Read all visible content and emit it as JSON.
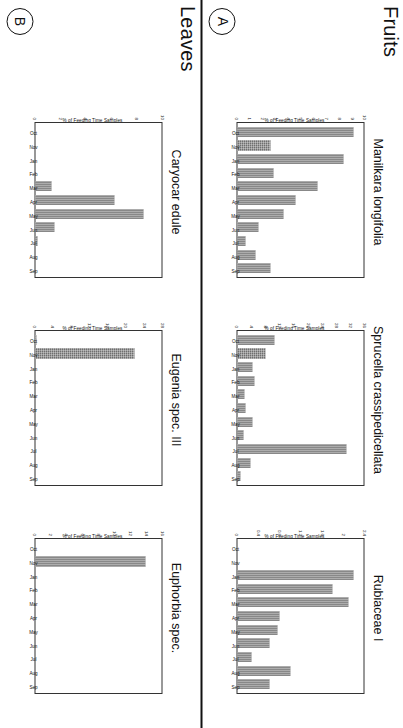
{
  "figure": {
    "sections": [
      {
        "id": "fruits",
        "label": "Fruits",
        "panel_tag": "A"
      },
      {
        "id": "leaves",
        "label": "Leaves",
        "panel_tag": "B"
      }
    ],
    "axis_label": "% of Feeding Time Samples",
    "months": [
      "Oct",
      "Nov",
      "Jan",
      "Feb",
      "Mar",
      "Apr",
      "May",
      "Jun",
      "Jul",
      "Aug",
      "Sep"
    ],
    "bar_color": "#6f6f6f"
  },
  "chart_data": [
    {
      "id": "manilkara-longifolia",
      "type": "bar",
      "title": "Manilkara longifolia",
      "section": "Fruits",
      "panel": "A",
      "xlabel": "",
      "ylabel": "% of Feeding Time Samples",
      "categories": [
        "Oct",
        "Nov",
        "Jan",
        "Feb",
        "Mar",
        "Apr",
        "May",
        "Jun",
        "Jul",
        "Aug",
        "Sep"
      ],
      "values": [
        9.2,
        2.6,
        8.4,
        2.8,
        6.3,
        4.6,
        3.6,
        1.6,
        0.6,
        1.4,
        2.6
      ],
      "ylim": [
        0,
        10
      ],
      "yticks": [
        0,
        1,
        2,
        3,
        4,
        5,
        6,
        7,
        8,
        9,
        10
      ],
      "grid": false,
      "legend": false
    },
    {
      "id": "sprucella-crassipedicellata",
      "type": "bar",
      "title": "Sprucella crassipedicellata",
      "section": "Fruits",
      "panel": "A",
      "xlabel": "",
      "ylabel": "% of Feeding Time Samples",
      "categories": [
        "Oct",
        "Nov",
        "Jan",
        "Feb",
        "Mar",
        "Apr",
        "May",
        "Jun",
        "Jul",
        "Aug",
        "Sep"
      ],
      "values": [
        10.5,
        7.8,
        4.2,
        4.6,
        2.0,
        2.2,
        4.2,
        1.6,
        31.0,
        3.6,
        0.8
      ],
      "ylim": [
        0,
        36
      ],
      "yticks": [
        0,
        4,
        8,
        12,
        16,
        20,
        24,
        28,
        32,
        36
      ],
      "grid": false,
      "legend": false
    },
    {
      "id": "rubiaceae-i",
      "type": "bar",
      "title": "Rubiaceae I",
      "section": "Leaves",
      "panel": "A",
      "xlabel": "",
      "ylabel": "% of Feeding Time Samples",
      "categories": [
        "Oct",
        "Nov",
        "Jan",
        "Feb",
        "Mar",
        "Apr",
        "May",
        "Jun",
        "Jul",
        "Aug",
        "Sep"
      ],
      "values": [
        0,
        0,
        2.2,
        1.8,
        2.1,
        0.8,
        0.75,
        0.6,
        0.25,
        1.0,
        0.6
      ],
      "ylim": [
        0,
        2.4
      ],
      "yticks": [
        0,
        0.4,
        0.8,
        1.2,
        1.6,
        2.0,
        2.4
      ],
      "grid": false,
      "legend": false
    },
    {
      "id": "caryocar-edule",
      "type": "bar",
      "title": "Caryocar edule",
      "section": "Fruits",
      "panel": "B",
      "xlabel": "",
      "ylabel": "% of Feeding Time Samples",
      "categories": [
        "Oct",
        "Nov",
        "Jan",
        "Feb",
        "Mar",
        "Apr",
        "May",
        "Jun",
        "Jul",
        "Aug",
        "Sep"
      ],
      "values": [
        0,
        0,
        0,
        0,
        1.3,
        6.3,
        8.6,
        1.5,
        0.15,
        0,
        0
      ],
      "ylim": [
        0,
        10
      ],
      "yticks": [
        0,
        2,
        4,
        6,
        8,
        10
      ],
      "grid": false,
      "legend": false
    },
    {
      "id": "eugenia-spec-iii",
      "type": "bar",
      "title": "Eugenia spec. III",
      "section": "Fruits",
      "panel": "B",
      "xlabel": "",
      "ylabel": "% of Feeding Time Samples",
      "categories": [
        "Oct",
        "Nov",
        "Jan",
        "Feb",
        "Mar",
        "Apr",
        "May",
        "Jun",
        "Jul",
        "Aug",
        "Sep"
      ],
      "values": [
        0.3,
        22.0,
        0,
        0,
        0,
        0,
        0,
        0,
        0,
        0,
        0
      ],
      "ylim": [
        0,
        28
      ],
      "yticks": [
        0,
        4,
        8,
        12,
        16,
        20,
        24,
        28
      ],
      "grid": false,
      "legend": false
    },
    {
      "id": "euphorbia-spec",
      "type": "bar",
      "title": "Euphorbia spec.",
      "section": "Leaves",
      "panel": "B",
      "xlabel": "",
      "ylabel": "% of Feeding Time Samples",
      "categories": [
        "Oct",
        "Nov",
        "Jan",
        "Feb",
        "Mar",
        "Apr",
        "May",
        "Jun",
        "Jul",
        "Aug",
        "Sep"
      ],
      "values": [
        0,
        14.0,
        0,
        0,
        0,
        0,
        0,
        0,
        0,
        0,
        0
      ],
      "ylim": [
        0,
        16
      ],
      "yticks": [
        0,
        2,
        4,
        6,
        8,
        10,
        12,
        14,
        16
      ],
      "grid": false,
      "legend": false
    }
  ]
}
